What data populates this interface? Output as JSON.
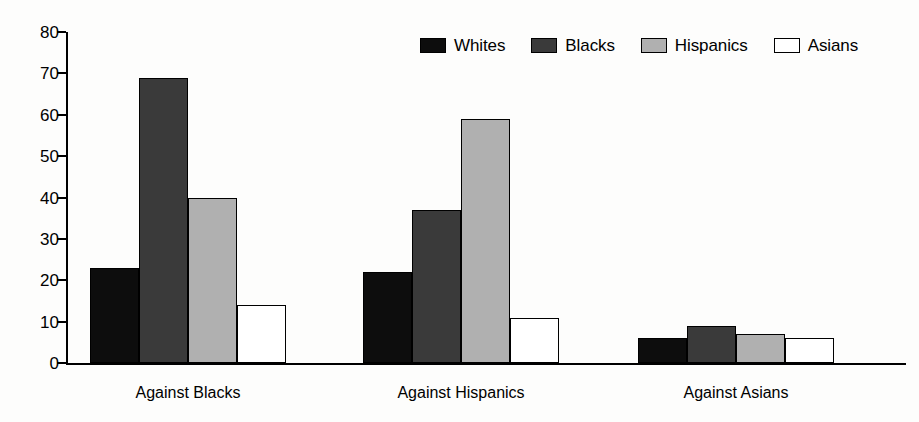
{
  "chart_data": {
    "type": "bar",
    "title": "",
    "subtitle": "",
    "xlabel": "",
    "ylabel": "",
    "ylim": [
      0,
      80
    ],
    "yticks": [
      0,
      10,
      20,
      30,
      40,
      50,
      60,
      70,
      80
    ],
    "ytick_labels": [
      "0",
      "10",
      "20",
      "30",
      "40",
      "50",
      "60",
      "70",
      "80"
    ],
    "grid": false,
    "legend_position": "top-right",
    "categories": [
      "Against Blacks",
      "Against Hispanics",
      "Against Asians"
    ],
    "series": [
      {
        "name": "Whites",
        "color": "#0d0d0d",
        "values": [
          23,
          22,
          6
        ]
      },
      {
        "name": "Blacks",
        "color": "#3a3a3a",
        "values": [
          69,
          37,
          9
        ]
      },
      {
        "name": "Hispanics",
        "color": "#b0b0b0",
        "values": [
          40,
          59,
          7
        ]
      },
      {
        "name": "Asians",
        "color": "#ffffff",
        "values": [
          14,
          11,
          6
        ]
      }
    ]
  },
  "legend": {
    "items": [
      {
        "label": "Whites",
        "swatch": "legend-swatch-whites"
      },
      {
        "label": "Blacks",
        "swatch": "legend-swatch-blacks"
      },
      {
        "label": "Hispanics",
        "swatch": "legend-swatch-hispanics"
      },
      {
        "label": "Asians",
        "swatch": "legend-swatch-asians"
      }
    ]
  }
}
